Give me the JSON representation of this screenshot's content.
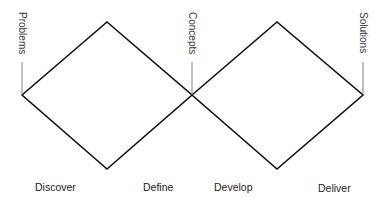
{
  "diagram": {
    "stroke_color": "#111111",
    "tick_color": "#555555",
    "milestones": [
      {
        "id": "problems",
        "label": "Problems"
      },
      {
        "id": "concepts",
        "label": "Concepts"
      },
      {
        "id": "solutions",
        "label": "Solutions"
      }
    ],
    "phases": [
      {
        "id": "discover",
        "label": "Discover"
      },
      {
        "id": "define",
        "label": "Define"
      },
      {
        "id": "develop",
        "label": "Develop"
      },
      {
        "id": "deliver",
        "label": "Deliver"
      }
    ],
    "diamonds": [
      {
        "id": "problem-space",
        "from": "problems",
        "to": "concepts"
      },
      {
        "id": "solution-space",
        "from": "concepts",
        "to": "solutions"
      }
    ]
  }
}
